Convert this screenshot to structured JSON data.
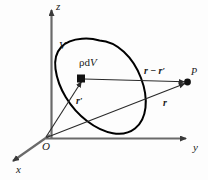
{
  "figure": {
    "type": "physics-vector-diagram",
    "background_color": "#fdfdfd",
    "stroke_color": "#1a1a1a",
    "axis_color": "#555555",
    "vector_color": "#3a3a3a",
    "volume_outline_color": "#000000"
  },
  "axes": {
    "z": {
      "label": "z",
      "x": 56,
      "y": 1
    },
    "y": {
      "label": "y",
      "x": 193,
      "y": 143
    },
    "x": {
      "label": "x",
      "x": 16,
      "y": 165
    },
    "origin": {
      "label": "O",
      "x": 42,
      "y": 142
    }
  },
  "volume": {
    "label": "V",
    "label_x": 59,
    "label_y": 41
  },
  "element": {
    "label_rho": "ρ",
    "label_d": "d",
    "label_V": "V",
    "label_full": "ρdV",
    "label_x": 80,
    "label_y": 58,
    "marker": "filled-square",
    "marker_x": 81,
    "marker_y": 79
  },
  "point": {
    "label": "P",
    "label_x": 191,
    "label_y": 68,
    "marker": "filled-circle",
    "marker_x": 188,
    "marker_y": 82
  },
  "vectors": [
    {
      "name": "r-prime",
      "label": "r",
      "prime": "′",
      "label_x": 76,
      "label_y": 92,
      "from": [
        46,
        138
      ],
      "to": [
        82,
        80
      ]
    },
    {
      "name": "r-minus-r-prime",
      "label": "r",
      "operator": " − ",
      "label2": "r",
      "prime": "′",
      "label_x": 145,
      "label_y": 62,
      "from": [
        84,
        79
      ],
      "to": [
        186,
        82
      ]
    },
    {
      "name": "r",
      "label": "r",
      "label_x": 163,
      "label_y": 94,
      "from": [
        46,
        138
      ],
      "to": [
        186,
        83
      ]
    }
  ]
}
